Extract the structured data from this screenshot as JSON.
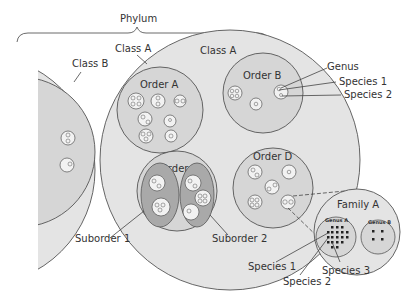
{
  "diagram": {
    "title": "Phylum",
    "colors": {
      "class_fill": "#e4e4e4",
      "order_fill": "#d6d6d6",
      "suborder_fill": "#a9a9a9",
      "genus_fill": "#f2f2f2",
      "stroke": "#555555",
      "text": "#333333"
    },
    "labels": {
      "phylum": "Phylum",
      "class_a_outer": "Class A",
      "class_a_inner": "Class A",
      "class_b": "Class B",
      "order_a": "Order A",
      "order_b": "Order B",
      "order_c": "Order C",
      "order_d": "Order D",
      "suborder_1": "Suborder 1",
      "suborder_2": "Suborder 2",
      "genus": "Genus",
      "species_1_top": "Species 1",
      "species_2_top": "Species 2",
      "family_a": "Family A",
      "genus_a": "Genus A",
      "genus_b": "Genus B",
      "species_1_bottom": "Species 1",
      "species_2_bottom": "Species 2",
      "species_3_bottom": "Species 3"
    }
  }
}
